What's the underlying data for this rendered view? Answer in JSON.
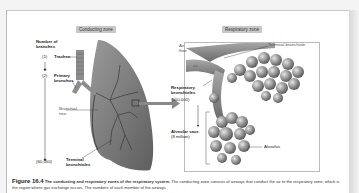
{
  "figure": {
    "number": "Figure 16.4",
    "title": "The conducting and respiratory zones of the respiratory system.",
    "caption_text": "The conducting zone consists of airways that conduct the air to the respiratory zone, which is the region where gas exchange occurs. The numbers of each member of the airways"
  },
  "conducting_zone": {
    "header": "Conducting zone",
    "number_of_branches_label": "Number of branches",
    "labels": [
      {
        "count": "(1)",
        "name": "Trachea"
      },
      {
        "count": "(2)",
        "name": "Primary bronchus"
      },
      {
        "count": "(60,000)",
        "name": "Terminal bronchioles"
      }
    ],
    "bronchial_tree_label": "Bronchial tree"
  },
  "respiratory_zone": {
    "header": "Respiratory zone",
    "air_flow_label": "Air flow",
    "terminal_bronchiole_label": "Terminal bronchiole",
    "respiratory_bronchioles": {
      "name": "Respiratory bronchioles",
      "count": "(500,000)"
    },
    "alveolar_sacs": {
      "name": "Alveolar sacs",
      "count": "(8 million)"
    },
    "alveolus_label": "Alveolus"
  },
  "colors": {
    "zone_label_bg": "#c8c8c8",
    "lung_gray": "#8a8a8a",
    "arrow_gray": "#888888"
  }
}
